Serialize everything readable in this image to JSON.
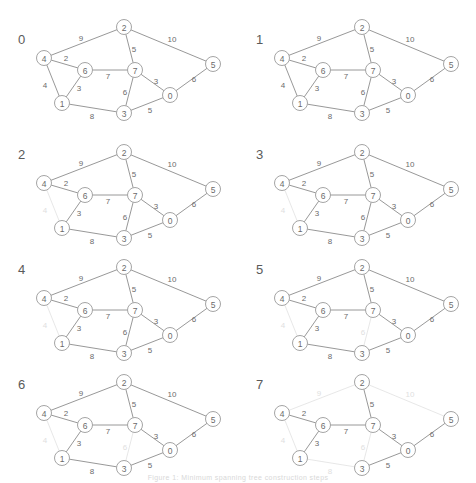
{
  "figure": {
    "caption": "Figure 1: Minimum spanning tree construction steps",
    "panel_count": 8,
    "colors": {
      "active_stroke": "#8c8c8c",
      "active_text": "#6b6b6b",
      "faded_stroke": "#e4e4e4",
      "faded_text": "#e0e0e0",
      "node_stroke": "#9a9a9a",
      "node_fill": "#ffffff",
      "step_label": "#5a5a5a",
      "background": "#ffffff"
    }
  },
  "graph": {
    "nodes": [
      {
        "id": "2",
        "label": "2",
        "x": 124,
        "y": 27
      },
      {
        "id": "4",
        "label": "4",
        "x": 44,
        "y": 58
      },
      {
        "id": "5",
        "label": "5",
        "x": 213,
        "y": 64
      },
      {
        "id": "6",
        "label": "6",
        "x": 85,
        "y": 70
      },
      {
        "id": "7",
        "label": "7",
        "x": 135,
        "y": 70
      },
      {
        "id": "0",
        "label": "0",
        "x": 170,
        "y": 95
      },
      {
        "id": "1",
        "label": "1",
        "x": 62,
        "y": 103
      },
      {
        "id": "3",
        "label": "3",
        "x": 124,
        "y": 113
      }
    ],
    "edges": [
      {
        "id": "e_4_2",
        "from": "4",
        "to": "2",
        "weight": "9",
        "lx": 81,
        "ly": 38
      },
      {
        "id": "e_2_5",
        "from": "2",
        "to": "5",
        "weight": "10",
        "lx": 172,
        "ly": 39
      },
      {
        "id": "e_2_7",
        "from": "2",
        "to": "7",
        "weight": "5",
        "lx": 134,
        "ly": 49
      },
      {
        "id": "e_4_6",
        "from": "4",
        "to": "6",
        "weight": "2",
        "lx": 66,
        "ly": 58
      },
      {
        "id": "e_6_7",
        "from": "6",
        "to": "7",
        "weight": "7",
        "lx": 108,
        "ly": 76
      },
      {
        "id": "e_7_0",
        "from": "7",
        "to": "0",
        "weight": "3",
        "lx": 156,
        "ly": 81
      },
      {
        "id": "e_0_5",
        "from": "0",
        "to": "5",
        "weight": "6",
        "lx": 194,
        "ly": 79
      },
      {
        "id": "e_4_1",
        "from": "4",
        "to": "1",
        "weight": "4",
        "lx": 45,
        "ly": 85
      },
      {
        "id": "e_6_1",
        "from": "6",
        "to": "1",
        "weight": "3",
        "lx": 79,
        "ly": 88
      },
      {
        "id": "e_7_3",
        "from": "7",
        "to": "3",
        "weight": "6",
        "lx": 125,
        "ly": 92
      },
      {
        "id": "e_0_3",
        "from": "0",
        "to": "3",
        "weight": "5",
        "lx": 150,
        "ly": 110
      },
      {
        "id": "e_1_3",
        "from": "1",
        "to": "3",
        "weight": "8",
        "lx": 92,
        "ly": 116
      }
    ]
  },
  "panels": [
    {
      "step": "0",
      "label_x": 18,
      "label_y": 33,
      "faded_edges": []
    },
    {
      "step": "1",
      "label_x": 18,
      "label_y": 33,
      "faded_edges": []
    },
    {
      "step": "2",
      "label_x": 18,
      "label_y": 8,
      "faded_edges": [
        "e_4_1"
      ]
    },
    {
      "step": "3",
      "label_x": 18,
      "label_y": 8,
      "faded_edges": [
        "e_4_1"
      ]
    },
    {
      "step": "4",
      "label_x": 18,
      "label_y": 8,
      "faded_edges": [
        "e_4_1"
      ]
    },
    {
      "step": "5",
      "label_x": 18,
      "label_y": 8,
      "faded_edges": [
        "e_4_1",
        "e_7_3"
      ]
    },
    {
      "step": "6",
      "label_x": 18,
      "label_y": 8,
      "faded_edges": [
        "e_4_1",
        "e_7_3"
      ]
    },
    {
      "step": "7",
      "label_x": 18,
      "label_y": 8,
      "faded_edges": [
        "e_4_1",
        "e_7_3",
        "e_4_2",
        "e_2_5",
        "e_1_3"
      ]
    }
  ]
}
